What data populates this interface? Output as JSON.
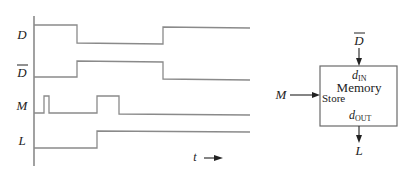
{
  "timing_diagram": {
    "signals": [
      {
        "name": "D",
        "overbar": false,
        "label": "D"
      },
      {
        "name": "D_bar",
        "overbar": true,
        "label": "D"
      },
      {
        "name": "M",
        "overbar": false,
        "label": "M"
      },
      {
        "name": "L",
        "overbar": false,
        "label": "L"
      }
    ],
    "time_label": "t",
    "time_arrow": "→"
  },
  "memory_block": {
    "title": "Memory",
    "input_label_main": "d",
    "input_label_sub": "IN",
    "output_label_main": "d",
    "output_label_sub": "OUT",
    "store_label": "Store",
    "top_input_signal": "D",
    "top_input_overbar": true,
    "left_input_signal": "M",
    "bottom_output_signal": "L"
  },
  "colors": {
    "waveform": "#8a8a8a",
    "text": "#222222",
    "background": "#ffffff"
  }
}
